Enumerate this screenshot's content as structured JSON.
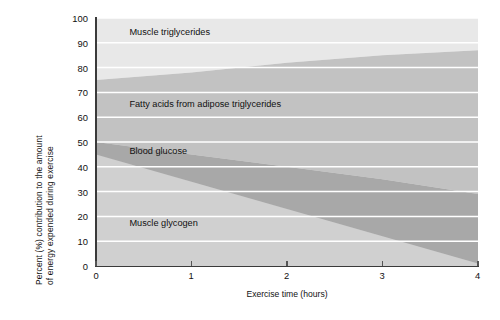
{
  "chart_data": {
    "type": "area",
    "stacked": true,
    "title": "",
    "subtitle": "",
    "xlabel": "Exercise time (hours)",
    "ylabel": "Percent (%) contribution to the amount of energy expended during exercise",
    "ylabel_lines": [
      "Percent (%) contribution to the amount",
      "of energy expended during exercise"
    ],
    "xlim": [
      0,
      4
    ],
    "ylim": [
      0,
      100
    ],
    "xticks": [
      "0",
      "1",
      "2",
      "3",
      "4"
    ],
    "yticks": [
      "0",
      "10",
      "20",
      "30",
      "40",
      "50",
      "60",
      "70",
      "80",
      "90",
      "100"
    ],
    "grid": "horizontal-white-gridlines",
    "legend_position": "inline-annotations",
    "x": [
      0,
      1,
      2,
      3,
      4
    ],
    "series": [
      {
        "name": "Muscle glycogen",
        "order": 1,
        "color": "#d0d0d0",
        "values": [
          45,
          34,
          23,
          12,
          1
        ],
        "label_x": 0.35,
        "label_y": 17
      },
      {
        "name": "Blood glucose",
        "order": 2,
        "color": "#a8a8a8",
        "values": [
          5,
          11,
          17,
          23,
          28
        ],
        "label_x": 0.35,
        "label_y": 46
      },
      {
        "name": "Fatty acids from adipose triglycerides",
        "order": 3,
        "color": "#c2c2c2",
        "values": [
          25,
          33,
          42,
          50,
          58
        ],
        "label_x": 0.35,
        "label_y": 65
      },
      {
        "name": "Muscle triglycerides",
        "order": 4,
        "color": "#e8e8e8",
        "values": [
          25,
          22,
          18,
          15,
          13
        ],
        "label_x": 0.35,
        "label_y": 94
      }
    ],
    "cumulative_boundaries": {
      "muscle_glycogen_top": [
        45,
        34,
        23,
        12,
        1
      ],
      "blood_glucose_top": [
        50,
        45,
        40,
        35,
        29
      ],
      "fatty_acids_top": [
        75,
        78,
        82,
        85,
        87
      ],
      "muscle_triglycerides_top": [
        100,
        100,
        100,
        100,
        100
      ]
    },
    "colors": {
      "plot_background": "#d5d5d5",
      "gridline": "#ffffff",
      "axis": "#3a3a3a",
      "text": "#111111"
    }
  }
}
